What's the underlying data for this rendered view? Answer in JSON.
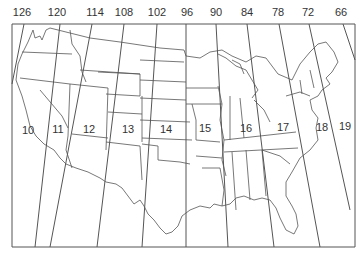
{
  "map": {
    "type": "UTM zones overlay on contiguous United States",
    "line_color": "#555555",
    "background": "#ffffff",
    "longitude_labels": [
      {
        "value": "126",
        "x": 22
      },
      {
        "value": "120",
        "x": 57
      },
      {
        "value": "114",
        "x": 95
      },
      {
        "value": "108",
        "x": 124
      },
      {
        "value": "102",
        "x": 157
      },
      {
        "value": "96",
        "x": 187
      },
      {
        "value": "90",
        "x": 216
      },
      {
        "value": "84",
        "x": 247
      },
      {
        "value": "78",
        "x": 278
      },
      {
        "value": "72",
        "x": 308
      },
      {
        "value": "66",
        "x": 341
      }
    ],
    "zone_labels": [
      {
        "value": "10",
        "x": 28,
        "y": 130
      },
      {
        "value": "11",
        "x": 58,
        "y": 129
      },
      {
        "value": "12",
        "x": 89,
        "y": 129
      },
      {
        "value": "13",
        "x": 128,
        "y": 129
      },
      {
        "value": "14",
        "x": 166,
        "y": 129
      },
      {
        "value": "15",
        "x": 205,
        "y": 128
      },
      {
        "value": "16",
        "x": 246,
        "y": 128
      },
      {
        "value": "17",
        "x": 283,
        "y": 127
      },
      {
        "value": "18",
        "x": 322,
        "y": 127
      },
      {
        "value": "19",
        "x": 345,
        "y": 126
      }
    ]
  }
}
